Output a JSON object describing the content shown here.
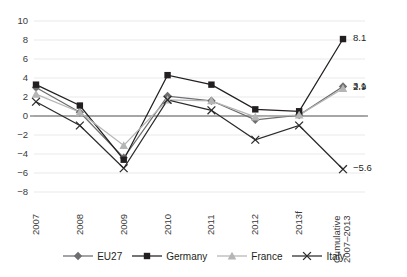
{
  "chart_data": {
    "type": "line",
    "title": "",
    "xlabel": "",
    "ylabel": "",
    "ylim": [
      -8,
      10
    ],
    "yticks": [
      10,
      8,
      6,
      4,
      2,
      0,
      -2,
      -4,
      -6,
      -8
    ],
    "ytick_labels": [
      "10",
      "8",
      "6",
      "4",
      "2",
      "0",
      "−2",
      "−4",
      "−6",
      "−8"
    ],
    "categories": [
      "2007",
      "2008",
      "2009",
      "2010",
      "2011",
      "2012",
      "2013f",
      "Cumulative\n2007–2013"
    ],
    "grid": true,
    "legend_position": "bottom",
    "zero_line": true,
    "series": [
      {
        "name": "EU27",
        "marker": "diamond",
        "color": "#6d6e71",
        "values": [
          3.0,
          0.4,
          -4.4,
          2.1,
          1.6,
          -0.4,
          0.1,
          3.1
        ],
        "end_label": "3.1"
      },
      {
        "name": "Germany",
        "marker": "square",
        "color": "#231f20",
        "values": [
          3.3,
          1.1,
          -4.6,
          4.3,
          3.3,
          0.7,
          0.5,
          8.1
        ],
        "end_label": "8.1"
      },
      {
        "name": "France",
        "marker": "triangle",
        "color": "#b5b5b5",
        "values": [
          2.3,
          0.4,
          -3.1,
          1.7,
          1.6,
          -0.1,
          0.1,
          2.9
        ],
        "end_label": "2.9"
      },
      {
        "name": "Italy",
        "marker": "cross",
        "color": "#2b2b2b",
        "values": [
          1.5,
          -1.0,
          -5.5,
          1.7,
          0.6,
          -2.5,
          -1.0,
          -5.6
        ],
        "end_label": "−5.6"
      }
    ],
    "annotations": [
      {
        "text": "8.1",
        "series": "Germany",
        "at_category": "Cumulative 2007–2013"
      },
      {
        "text": "3.1",
        "series": "EU27",
        "at_category": "Cumulative 2007–2013"
      },
      {
        "text": "2.9",
        "series": "France",
        "at_category": "Cumulative 2007–2013"
      },
      {
        "text": "−5.6",
        "series": "Italy",
        "at_category": "Cumulative 2007–2013"
      }
    ]
  },
  "legend": {
    "items": [
      {
        "label": "EU27",
        "marker": "diamond",
        "color": "#6d6e71"
      },
      {
        "label": "Germany",
        "marker": "square",
        "color": "#231f20"
      },
      {
        "label": "France",
        "marker": "triangle",
        "color": "#b5b5b5"
      },
      {
        "label": "Italy",
        "marker": "cross",
        "color": "#2b2b2b"
      }
    ]
  }
}
